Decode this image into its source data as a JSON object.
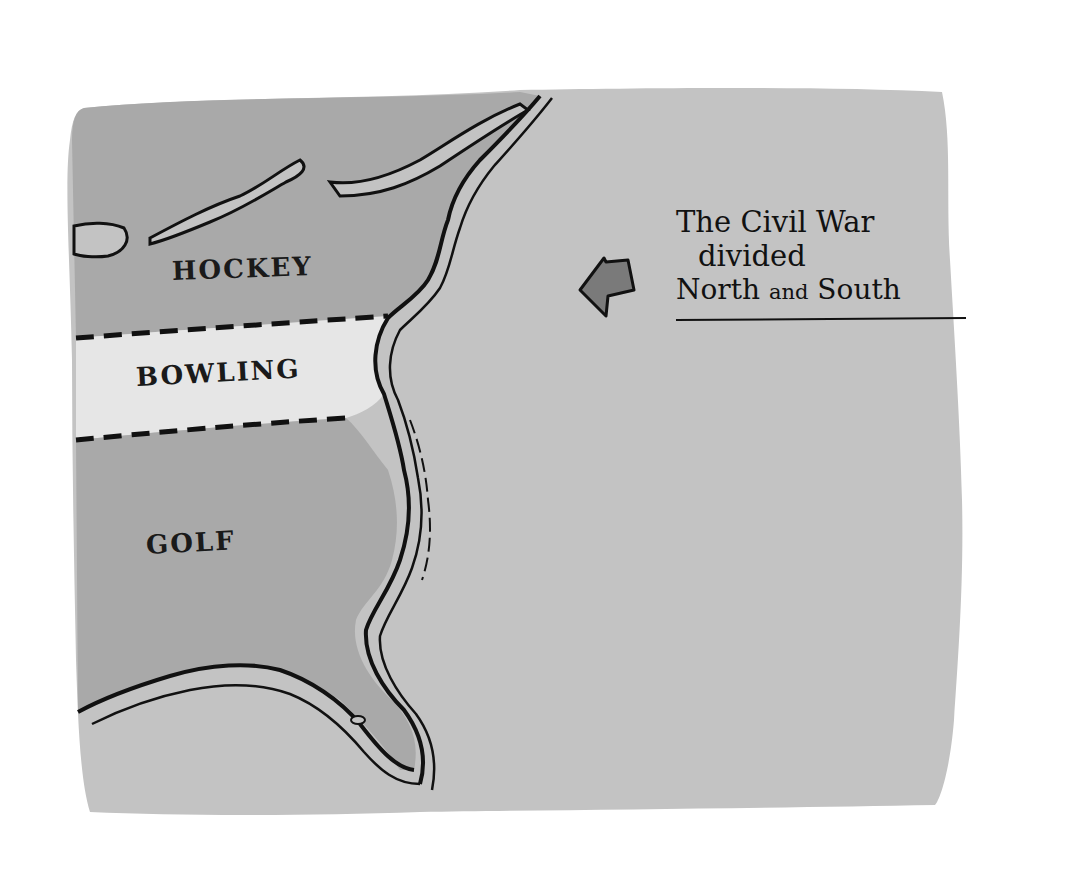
{
  "map": {
    "style": "hand-drawn cartoon map of the US East Coast",
    "colors": {
      "background": "#ffffff",
      "ocean": "#c3c3c3",
      "land": "#a9a9a9",
      "highlight_band": "#e6e6e6",
      "ink": "#111111",
      "arrow_fill": "#7a7a7a"
    },
    "regions": [
      {
        "id": "north",
        "label": "HOCKEY"
      },
      {
        "id": "middle",
        "label": "BOWLING"
      },
      {
        "id": "south",
        "label": "GOLF"
      }
    ],
    "annotation": {
      "arrow_icon": "left-arrow-icon",
      "lines": [
        "The Civil War",
        "divided",
        "North",
        "and",
        "South"
      ]
    }
  }
}
